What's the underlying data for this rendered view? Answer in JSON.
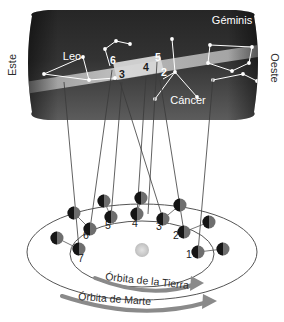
{
  "figure": {
    "type": "astronomy-diagram"
  },
  "sky": {
    "direction_left": "Este",
    "direction_right": "Oeste",
    "constellations": [
      {
        "name": "Leo",
        "label_x": 72,
        "label_y": 60
      },
      {
        "name": "Géminis",
        "label_x": 232,
        "label_y": 24
      },
      {
        "name": "Cáncer",
        "label_x": 188,
        "label_y": 104
      }
    ],
    "position_numbers": [
      {
        "label": "6",
        "x": 110,
        "y": 64,
        "dark": false
      },
      {
        "label": "3",
        "x": 119,
        "y": 78,
        "dark": true
      },
      {
        "label": "4",
        "x": 143,
        "y": 71,
        "dark": true
      },
      {
        "label": "5",
        "x": 155,
        "y": 61,
        "dark": false
      },
      {
        "label": "2",
        "x": 161,
        "y": 76,
        "dark": false
      }
    ]
  },
  "orbits": {
    "mars_label": "Órbita de Marte",
    "earth_label": "Órbita de la Tierra",
    "earth_positions": [
      {
        "label": "1",
        "dot_x": 198,
        "dot_y": 252,
        "num_x": 186,
        "num_y": 258
      },
      {
        "label": "2",
        "dot_x": 184,
        "dot_y": 232,
        "num_x": 173,
        "num_y": 239
      },
      {
        "label": "3",
        "dot_x": 163,
        "dot_y": 219,
        "num_x": 156,
        "num_y": 230
      },
      {
        "label": "4",
        "dot_x": 137,
        "dot_y": 214,
        "num_x": 132,
        "num_y": 227
      },
      {
        "label": "5",
        "dot_x": 111,
        "dot_y": 217,
        "num_x": 105,
        "num_y": 229
      },
      {
        "label": "6",
        "dot_x": 90,
        "dot_y": 229,
        "num_x": 83,
        "num_y": 239
      },
      {
        "label": "7",
        "dot_x": 79,
        "dot_y": 249,
        "num_x": 78,
        "num_y": 262
      }
    ],
    "mars_positions": [
      {
        "dot_x": 223,
        "dot_y": 249
      },
      {
        "dot_x": 209,
        "dot_y": 222
      },
      {
        "dot_x": 180,
        "dot_y": 205
      },
      {
        "dot_x": 141,
        "dot_y": 198
      },
      {
        "dot_x": 104,
        "dot_y": 201
      },
      {
        "dot_x": 74,
        "dot_y": 213
      },
      {
        "dot_x": 57,
        "dot_y": 238
      }
    ]
  },
  "colors": {
    "background": "#ffffff",
    "sky_dark": "#2a2a2a",
    "sky_mid": "#4a4a4a",
    "ecliptic_band": "#b9b9b9",
    "retrograde_band": "#d9d9d9",
    "star": "#ffffff",
    "planet_dark": "#151515",
    "planet_shade": "#6e6e6e",
    "sun": "#cfcfcf",
    "orbit_line": "#555555",
    "sight_line": "#3a3a3a",
    "arrow": "#8a8a8a"
  }
}
